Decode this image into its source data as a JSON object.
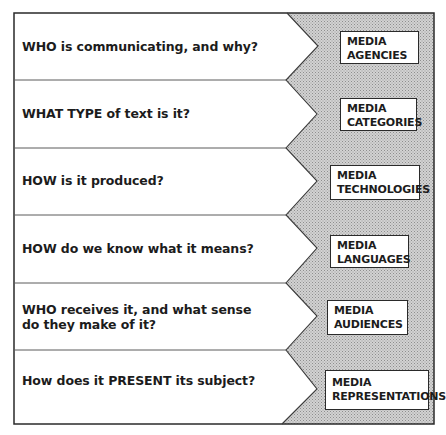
{
  "rows": [
    {
      "question": "WHO is communicating, and why?",
      "concept_line1": "MEDIA",
      "concept_line2": "AGENCIES"
    },
    {
      "question": "WHAT TYPE of text is it?",
      "concept_line1": "MEDIA",
      "concept_line2": "CATEGORIES"
    },
    {
      "question": "HOW is it produced?",
      "concept_line1": "MEDIA",
      "concept_line2": "TECHNOLOGIES"
    },
    {
      "question": "HOW do we know what it means?",
      "concept_line1": "MEDIA",
      "concept_line2": "LANGUAGES"
    },
    {
      "question": "WHO receives it, and what sense do they make of it?",
      "concept_line1": "MEDIA",
      "concept_line2": "AUDIENCES"
    },
    {
      "question": "How does it PRESENT its subject?",
      "concept_line1": "MEDIA",
      "concept_line2": "REPRESENTATIONS"
    }
  ],
  "colors": {
    "line": "#2a2a2a",
    "hatch_dark": "#8a8a8a",
    "hatch_light": "#e6e6e6",
    "background": "#ffffff"
  }
}
